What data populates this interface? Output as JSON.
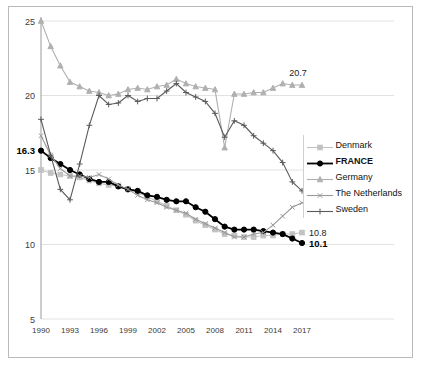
{
  "chart_data": {
    "type": "line",
    "title": "",
    "subtitle": "",
    "xlabel": "",
    "ylabel": "",
    "xlim": [
      1990,
      2017
    ],
    "ylim": [
      5,
      25
    ],
    "grid": true,
    "legend_position": "right",
    "x": [
      1990,
      1991,
      1992,
      1993,
      1994,
      1995,
      1996,
      1997,
      1998,
      1999,
      2000,
      2001,
      2002,
      2003,
      2004,
      2005,
      2006,
      2007,
      2008,
      2009,
      2010,
      2011,
      2012,
      2013,
      2014,
      2015,
      2016,
      2017
    ],
    "y_ticks": [
      "5",
      "10",
      "15",
      "20",
      "25"
    ],
    "y_tick_values": [
      5,
      10,
      15,
      20,
      25
    ],
    "x_ticks": [
      "1990",
      "1993",
      "1996",
      "1999",
      "2002",
      "2005",
      "2008",
      "2011",
      "2014",
      "2017"
    ],
    "x_tick_values": [
      1990,
      1993,
      1996,
      1999,
      2002,
      2005,
      2008,
      2011,
      2014,
      2017
    ],
    "series": [
      {
        "name": "Denmark",
        "color": "#c2c2c2",
        "marker": "square",
        "bold": false,
        "end_label": "10.8",
        "start_label": "",
        "values": [
          15.0,
          14.8,
          14.7,
          14.6,
          14.5,
          14.3,
          14.1,
          14.0,
          13.9,
          13.7,
          13.5,
          13.2,
          12.9,
          12.6,
          12.3,
          12.0,
          11.6,
          11.3,
          11.0,
          10.7,
          10.6,
          10.5,
          10.5,
          10.6,
          10.6,
          10.7,
          10.7,
          10.8
        ]
      },
      {
        "name": "FRANCE",
        "color": "#000000",
        "marker": "circle",
        "bold": true,
        "end_label": "10.1",
        "start_label": "16.3",
        "values": [
          16.3,
          15.8,
          15.4,
          15.0,
          14.7,
          14.4,
          14.2,
          14.2,
          13.9,
          13.7,
          13.6,
          13.3,
          13.2,
          13.0,
          12.9,
          12.9,
          12.5,
          12.2,
          11.7,
          11.2,
          11.0,
          11.0,
          11.0,
          10.9,
          10.8,
          10.7,
          10.4,
          10.1
        ]
      },
      {
        "name": "Germany",
        "color": "#b0b0b0",
        "marker": "triangle",
        "bold": false,
        "end_label": "20.7",
        "start_label": "",
        "values": [
          25.0,
          23.3,
          22.0,
          20.9,
          20.6,
          20.3,
          20.2,
          20.0,
          20.1,
          20.4,
          20.5,
          20.4,
          20.6,
          20.7,
          21.1,
          20.8,
          20.6,
          20.5,
          20.4,
          16.5,
          20.1,
          20.1,
          20.2,
          20.2,
          20.5,
          20.8,
          20.7,
          20.7
        ]
      },
      {
        "name": "The Netherlands",
        "color": "#9a9a9a",
        "marker": "x",
        "bold": false,
        "end_label": "12.8",
        "start_label": "",
        "values": [
          17.3,
          16.0,
          15.1,
          14.6,
          14.6,
          14.5,
          14.7,
          14.4,
          14.0,
          13.7,
          13.3,
          13.0,
          12.8,
          12.5,
          12.3,
          12.1,
          11.7,
          11.4,
          11.1,
          10.8,
          10.5,
          10.5,
          10.7,
          10.8,
          11.3,
          11.9,
          12.5,
          12.8
        ]
      },
      {
        "name": "Sweden",
        "color": "#5a5a5a",
        "marker": "plus",
        "bold": false,
        "end_label": "13.6",
        "start_label": "",
        "values": [
          18.4,
          16.0,
          13.7,
          13.0,
          15.4,
          18.0,
          20.0,
          19.4,
          19.5,
          20.0,
          19.6,
          19.8,
          19.8,
          20.3,
          20.8,
          20.2,
          19.9,
          19.6,
          18.8,
          17.2,
          18.3,
          18.0,
          17.3,
          16.8,
          16.3,
          15.5,
          14.2,
          13.6
        ]
      }
    ],
    "annotations": [
      {
        "text": "16.3",
        "series": "FRANCE",
        "position": "start",
        "bold": true
      },
      {
        "text": "20.7",
        "series": "Germany",
        "position": "end",
        "bold": false
      },
      {
        "text": "13.6",
        "series": "Sweden",
        "position": "end",
        "bold": false
      },
      {
        "text": "12.8",
        "series": "The Netherlands",
        "position": "end",
        "bold": false
      },
      {
        "text": "10.8",
        "series": "Denmark",
        "position": "end",
        "bold": false
      },
      {
        "text": "10.1",
        "series": "FRANCE",
        "position": "end",
        "bold": true
      }
    ]
  },
  "legend": {
    "items": [
      {
        "label": "Denmark",
        "bold": false
      },
      {
        "label": "FRANCE",
        "bold": true
      },
      {
        "label": "Germany",
        "bold": false
      },
      {
        "label": "The Netherlands",
        "bold": false
      },
      {
        "label": "Sweden",
        "bold": false
      }
    ]
  }
}
